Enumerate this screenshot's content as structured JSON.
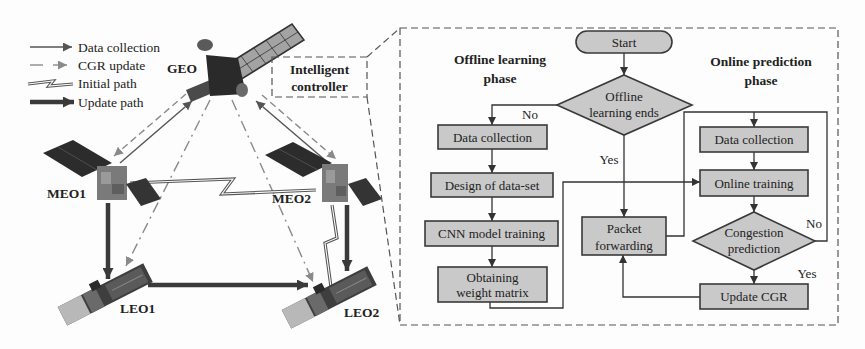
{
  "legend": {
    "items": [
      {
        "label": "Data collection",
        "style": "solid-arrow"
      },
      {
        "label": "CGR update",
        "style": "dashed-arrow"
      },
      {
        "label": "Initial path",
        "style": "zigzag-line"
      },
      {
        "label": "Update path",
        "style": "thick-arrow"
      }
    ]
  },
  "network": {
    "geo": "GEO",
    "meo1": "MEO1",
    "meo2": "MEO2",
    "leo1": "LEO1",
    "leo2": "LEO2",
    "controller": {
      "line1": "Intelligent",
      "line2": "controller"
    }
  },
  "flowchart": {
    "start": "Start",
    "offline_phase": {
      "line1": "Offline learning",
      "line2": "phase"
    },
    "online_phase": {
      "line1": "Online prediction",
      "line2": "phase"
    },
    "offline_decision": {
      "line1": "Offline",
      "line2": "learning ends",
      "no_label": "No",
      "yes_label": "Yes"
    },
    "offline_steps": {
      "data_collection": "Data collection",
      "design_dataset": "Design of data-set",
      "cnn_training": "CNN model training",
      "weight_matrix": {
        "line1": "Obtaining",
        "line2": "weight matrix"
      }
    },
    "packet_forwarding": {
      "line1": "Packet",
      "line2": "forwarding"
    },
    "online_steps": {
      "data_collection": "Data collection",
      "online_training": "Online training",
      "update_cgr": "Update CGR"
    },
    "congestion_decision": {
      "line1": "Congestion",
      "line2": "prediction",
      "no_label": "No",
      "yes_label": "Yes"
    }
  },
  "colors": {
    "background": "#fdfdfd",
    "box_fill": "#c9c9c9",
    "box_stroke": "#3a3a3a",
    "text": "#222222",
    "arrow": "#333333",
    "light_arrow": "#8a8a8a",
    "panel_dark": "#2c2c2c",
    "panel_light": "#9c9c9c"
  }
}
